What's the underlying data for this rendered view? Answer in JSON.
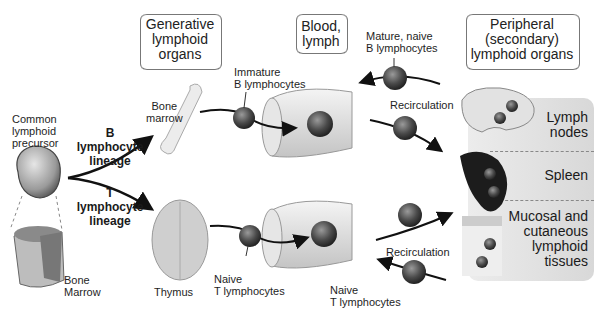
{
  "headers": {
    "generative": [
      "Generative",
      "lymphoid",
      "organs"
    ],
    "blood": [
      "Blood,",
      "lymph"
    ],
    "peripheral": [
      "Peripheral",
      "(secondary)",
      "lymphoid organs"
    ]
  },
  "precursor": {
    "label": [
      "Common",
      "lymphoid",
      "precursor"
    ],
    "bone_marrow_section": [
      "Bone",
      "Marrow"
    ]
  },
  "lineages": {
    "b": [
      "B",
      "lymphocyte",
      "lineage"
    ],
    "t": [
      "T",
      "lymphocyte",
      "lineage"
    ]
  },
  "organs": {
    "bone_marrow": [
      "Bone",
      "marrow"
    ],
    "thymus": "Thymus"
  },
  "cells": {
    "immature_b": [
      "Immature",
      "B lymphocytes"
    ],
    "mature_b": [
      "Mature, naive",
      "B lymphocytes"
    ],
    "naive_t_left": [
      "Naive",
      "T lymphocytes"
    ],
    "naive_t_right": [
      "Naive",
      "T lymphocytes"
    ]
  },
  "recirculation": {
    "top": "Recirculation",
    "bottom": "Recirculation"
  },
  "peripheral_organs": {
    "lymph_nodes": [
      "Lymph",
      "nodes"
    ],
    "spleen": "Spleen",
    "mucosal": [
      "Mucosal and",
      "cutaneous",
      "lymphoid",
      "tissues"
    ]
  }
}
